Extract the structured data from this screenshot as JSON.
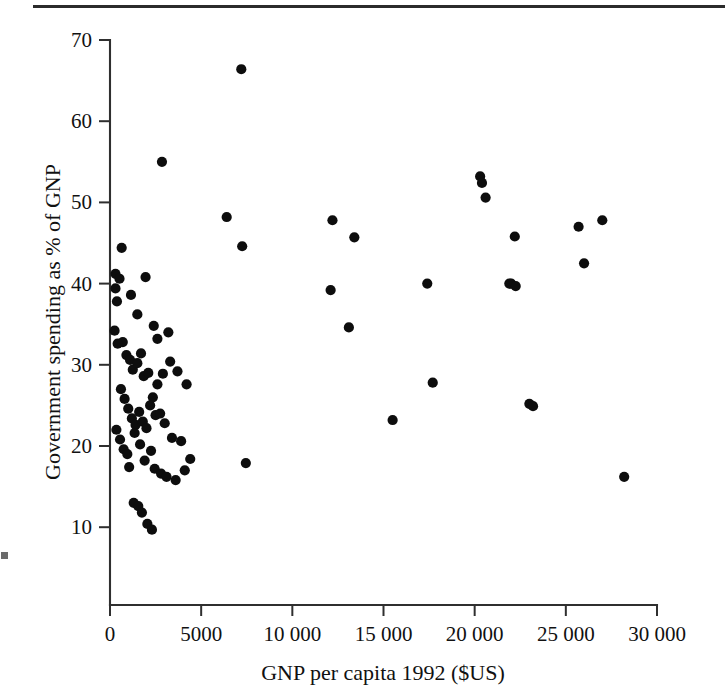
{
  "figure": {
    "has_top_rule": true,
    "background_color": "#ffffff",
    "marker_color": "#0d0d0d",
    "axis_color": "#2f2f2f"
  },
  "chart_data": {
    "type": "scatter",
    "title": "",
    "xlabel": "GNP per capita 1992 ($US)",
    "ylabel": "Government spending as % of GNP",
    "xlim": [
      0,
      30000
    ],
    "ylim": [
      0,
      70
    ],
    "grid": false,
    "legend": null,
    "xticks": [
      0,
      5000,
      10000,
      15000,
      20000,
      25000,
      30000
    ],
    "xtick_labels": [
      "0",
      "5000",
      "10 000",
      "15 000",
      "20 000",
      "25 000",
      "30 000"
    ],
    "yticks": [
      10,
      20,
      30,
      40,
      50,
      60,
      70
    ],
    "ytick_labels": [
      "10",
      "20",
      "30",
      "40",
      "50",
      "60",
      "70"
    ],
    "x": [
      7200,
      2850,
      6400,
      7250,
      300,
      520,
      640,
      1150,
      1500,
      1950,
      2400,
      2600,
      3200,
      12200,
      13400,
      20300,
      20400,
      20600,
      22200,
      25700,
      27000,
      22000,
      26000,
      300,
      380,
      700,
      900,
      1100,
      1250,
      1500,
      1700,
      1850,
      2100,
      2350,
      2600,
      2900,
      3300,
      3700,
      4200,
      12100,
      17400,
      21900,
      22250,
      13100,
      15500,
      17700,
      250,
      420,
      600,
      800,
      1000,
      1200,
      1400,
      1600,
      1800,
      2000,
      2200,
      2500,
      2750,
      3000,
      3400,
      3900,
      4400,
      23000,
      23200,
      28200,
      7450,
      350,
      550,
      750,
      950,
      1350,
      1650,
      1900,
      2250,
      2450,
      2800,
      3100,
      3600,
      4100,
      1050,
      1300,
      1550,
      1750,
      2050,
      2300
    ],
    "y": [
      66.4,
      55.0,
      48.2,
      44.6,
      41.2,
      40.6,
      44.4,
      38.6,
      36.2,
      40.8,
      34.8,
      33.2,
      34.0,
      47.8,
      45.7,
      53.2,
      52.4,
      50.6,
      45.8,
      47.0,
      47.8,
      40.0,
      42.5,
      39.4,
      37.8,
      32.8,
      31.2,
      30.6,
      29.4,
      30.2,
      31.4,
      28.6,
      29.0,
      26.0,
      27.6,
      28.9,
      30.4,
      29.2,
      27.6,
      39.2,
      40.0,
      40.0,
      39.7,
      34.6,
      23.2,
      27.8,
      34.2,
      32.6,
      27.0,
      25.8,
      24.6,
      23.4,
      22.6,
      24.2,
      23.0,
      22.2,
      25.0,
      23.8,
      24.0,
      22.8,
      21.0,
      20.6,
      18.4,
      25.2,
      24.9,
      16.2,
      17.9,
      22.0,
      20.8,
      19.6,
      19.0,
      21.6,
      20.2,
      18.2,
      19.4,
      17.2,
      16.6,
      16.2,
      15.8,
      17.0,
      17.4,
      13.0,
      12.6,
      11.8,
      10.4,
      9.7
    ]
  }
}
